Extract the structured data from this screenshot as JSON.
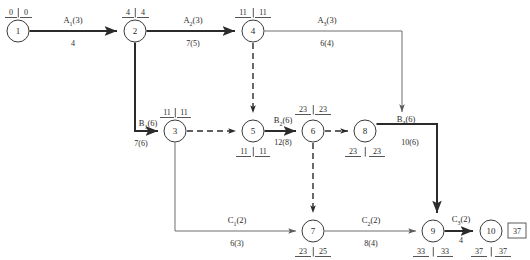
{
  "diagram": {
    "type": "activity-on-arrow-network",
    "title": "",
    "project_duration": "37",
    "node_time_separator": "|",
    "nodes": [
      {
        "id": "1",
        "label": "1",
        "x": 18,
        "y": 31,
        "r": 11,
        "times": "0 | 0",
        "early": "0",
        "late": "0",
        "times_pos": "above"
      },
      {
        "id": "2",
        "label": "2",
        "x": 135,
        "y": 31,
        "r": 11,
        "times": "4 | 4",
        "early": "4",
        "late": "4",
        "times_pos": "above"
      },
      {
        "id": "4",
        "label": "4",
        "x": 253,
        "y": 31,
        "r": 11,
        "times": "11 | 11",
        "early": "11",
        "late": "11",
        "times_pos": "above"
      },
      {
        "id": "3",
        "label": "3",
        "x": 175,
        "y": 131,
        "r": 11,
        "times": "11 | 11",
        "early": "11",
        "late": "11",
        "times_pos": "above"
      },
      {
        "id": "5",
        "label": "5",
        "x": 253,
        "y": 131,
        "r": 11,
        "times": "11 | 11",
        "early": "11",
        "late": "11",
        "times_pos": "below"
      },
      {
        "id": "6",
        "label": "6",
        "x": 313,
        "y": 131,
        "r": 11,
        "times": "23 | 23",
        "early": "23",
        "late": "23",
        "times_pos": "above"
      },
      {
        "id": "8",
        "label": "8",
        "x": 365,
        "y": 131,
        "r": 11,
        "times": "23 | 23",
        "early": "23",
        "late": "23",
        "times_pos": "below"
      },
      {
        "id": "7",
        "label": "7",
        "x": 313,
        "y": 231,
        "r": 11,
        "times": "23 | 25",
        "early": "23",
        "late": "25",
        "times_pos": "below"
      },
      {
        "id": "9",
        "label": "9",
        "x": 433,
        "y": 231,
        "r": 11,
        "times": "33 | 33",
        "early": "33",
        "late": "33",
        "times_pos": "below"
      },
      {
        "id": "10",
        "label": "10",
        "x": 491,
        "y": 231,
        "r": 11,
        "times": "37 | 37",
        "early": "37",
        "late": "37",
        "times_pos": "below"
      }
    ],
    "activities": [
      {
        "key": "a1",
        "name": "A",
        "sub": "1",
        "paren": "(3)",
        "duration": "4",
        "from": "1",
        "to": "2",
        "style": "critical"
      },
      {
        "key": "a2",
        "name": "A",
        "sub": "2",
        "paren": "(3)",
        "duration": "7(5)",
        "from": "2",
        "to": "4",
        "style": "critical"
      },
      {
        "key": "a3",
        "name": "A",
        "sub": "3",
        "paren": "(3)",
        "duration": "6(4)",
        "from": "4",
        "to": "8",
        "style": "normal"
      },
      {
        "key": "b1",
        "name": "B",
        "sub": "1",
        "paren": "(6)",
        "duration": "7(6)",
        "from": "2",
        "to": "3",
        "style": "critical"
      },
      {
        "key": "b2",
        "name": "B",
        "sub": "2",
        "paren": "(6)",
        "duration": "12(8)",
        "from": "5",
        "to": "6",
        "style": "critical"
      },
      {
        "key": "b3",
        "name": "B",
        "sub": "3",
        "paren": "(6)",
        "duration": "10(6)",
        "from": "8",
        "to": "9",
        "style": "critical"
      },
      {
        "key": "c1",
        "name": "C",
        "sub": "1",
        "paren": "(2)",
        "duration": "6(3)",
        "from": "3",
        "to": "7",
        "style": "normal"
      },
      {
        "key": "c2",
        "name": "C",
        "sub": "2",
        "paren": "(2)",
        "duration": "8(4)",
        "from": "7",
        "to": "9",
        "style": "normal"
      },
      {
        "key": "c3",
        "name": "C",
        "sub": "3",
        "paren": "(2)",
        "duration": "4",
        "from": "9",
        "to": "10",
        "style": "critical"
      }
    ],
    "dummy_links": [
      {
        "key": "d1",
        "from": "4",
        "to": "5"
      },
      {
        "key": "d2",
        "from": "3",
        "to": "5"
      },
      {
        "key": "d3",
        "from": "6",
        "to": "7"
      },
      {
        "key": "d4",
        "from": "6",
        "to": "8"
      }
    ],
    "labels": {
      "a1_name": "A",
      "a1_sub": "1",
      "a1_paren": "(3)",
      "a1_dur": "4",
      "a2_name": "A",
      "a2_sub": "2",
      "a2_paren": "(3)",
      "a2_dur": "7(5)",
      "a3_name": "A",
      "a3_sub": "3",
      "a3_paren": "(3)",
      "a3_dur": "6(4)",
      "b1_name": "B",
      "b1_sub": "1",
      "b1_paren": "(6)",
      "b1_dur": "7(6)",
      "b2_name": "B",
      "b2_sub": "2",
      "b2_paren": "(6)",
      "b2_dur": "12(8)",
      "b3_name": "B",
      "b3_sub": "3",
      "b3_paren": "(6)",
      "b3_dur": "10(6)",
      "c1_name": "C",
      "c1_sub": "1",
      "c1_paren": "(2)",
      "c1_dur": "6(3)",
      "c2_name": "C",
      "c2_sub": "2",
      "c2_paren": "(2)",
      "c2_dur": "8(4)",
      "c3_name": "C",
      "c3_sub": "3",
      "c3_paren": "(2)",
      "c3_dur": "4"
    },
    "node_times": {
      "n1_early": "0",
      "n1_late": "0",
      "n2_early": "4",
      "n2_late": "4",
      "n4_early": "11",
      "n4_late": "11",
      "n3_early": "11",
      "n3_late": "11",
      "n5_early": "11",
      "n5_late": "11",
      "n6_early": "23",
      "n6_late": "23",
      "n8_early": "23",
      "n8_late": "23",
      "n7_early": "23",
      "n7_late": "25",
      "n9_early": "33",
      "n9_late": "33",
      "n10_early": "37",
      "n10_late": "37"
    },
    "node_ids": {
      "n1": "1",
      "n2": "2",
      "n3": "3",
      "n4": "4",
      "n5": "5",
      "n6": "6",
      "n7": "7",
      "n8": "8",
      "n9": "9",
      "n10": "10"
    },
    "final_box": "37",
    "colors": {
      "critical_path": "#2b2b2b",
      "normal_path": "#6e6e6e",
      "node_stroke": "#3a3a3a",
      "text": "#2b2b2b",
      "background": "#ffffff"
    }
  }
}
